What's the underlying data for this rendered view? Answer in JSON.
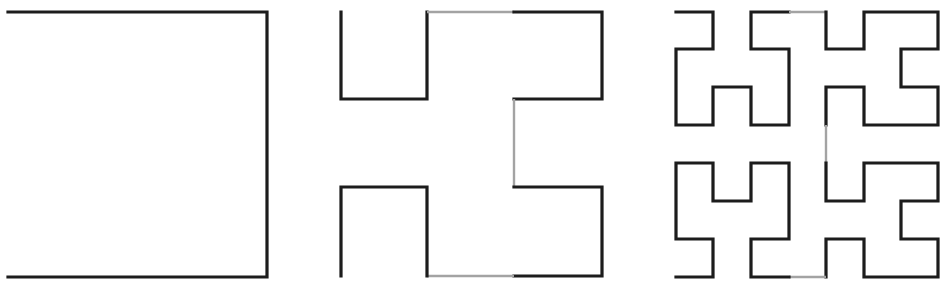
{
  "diagram": {
    "type": "hilbert-curve-iterations",
    "background": "#ffffff",
    "colors": {
      "curve": "#1c1c1c",
      "connector": "#a3a3a3"
    },
    "figures": [
      {
        "name": "order-1",
        "segments": [
          {
            "style": "black",
            "points": [
              [
                8,
                12
              ],
              [
                267,
                12
              ],
              [
                267,
                277
              ],
              [
                8,
                277
              ]
            ]
          }
        ]
      },
      {
        "name": "order-2",
        "segments": [
          {
            "style": "black",
            "points": [
              [
                341,
                12
              ],
              [
                341,
                99
              ],
              [
                427,
                99
              ],
              [
                427,
                12
              ]
            ]
          },
          {
            "style": "gray",
            "points": [
              [
                427,
                12
              ],
              [
                514,
                12
              ]
            ]
          },
          {
            "style": "black",
            "points": [
              [
                514,
                12
              ],
              [
                602,
                12
              ],
              [
                602,
                99
              ],
              [
                514,
                99
              ]
            ]
          },
          {
            "style": "gray",
            "points": [
              [
                514,
                99
              ],
              [
                514,
                187
              ]
            ]
          },
          {
            "style": "black",
            "points": [
              [
                514,
                187
              ],
              [
                602,
                187
              ],
              [
                602,
                276
              ],
              [
                514,
                276
              ]
            ]
          },
          {
            "style": "gray",
            "points": [
              [
                514,
                276
              ],
              [
                427,
                276
              ]
            ]
          },
          {
            "style": "black",
            "points": [
              [
                427,
                276
              ],
              [
                427,
                187
              ],
              [
                341,
                187
              ],
              [
                341,
                276
              ]
            ]
          }
        ]
      },
      {
        "name": "order-3",
        "segments": [
          {
            "style": "black",
            "points": [
              [
                676,
                12
              ],
              [
                713,
                12
              ],
              [
                713,
                49
              ],
              [
                676,
                49
              ],
              [
                676,
                125
              ],
              [
                713,
                125
              ],
              [
                713,
                87
              ],
              [
                751,
                87
              ],
              [
                751,
                125
              ],
              [
                789,
                125
              ],
              [
                789,
                49
              ],
              [
                751,
                49
              ],
              [
                751,
                12
              ],
              [
                789,
                12
              ]
            ]
          },
          {
            "style": "gray",
            "points": [
              [
                789,
                12
              ],
              [
                826,
                12
              ]
            ]
          },
          {
            "style": "black",
            "points": [
              [
                826,
                12
              ],
              [
                826,
                49
              ],
              [
                864,
                49
              ],
              [
                864,
                12
              ],
              [
                938,
                12
              ],
              [
                938,
                49
              ],
              [
                901,
                49
              ],
              [
                901,
                87
              ],
              [
                938,
                87
              ],
              [
                938,
                125
              ],
              [
                864,
                125
              ],
              [
                864,
                87
              ],
              [
                826,
                87
              ],
              [
                826,
                125
              ]
            ]
          },
          {
            "style": "gray",
            "points": [
              [
                826,
                125
              ],
              [
                826,
                163
              ]
            ]
          },
          {
            "style": "black",
            "points": [
              [
                826,
                163
              ],
              [
                826,
                201
              ],
              [
                864,
                201
              ],
              [
                864,
                163
              ],
              [
                938,
                163
              ],
              [
                938,
                201
              ],
              [
                901,
                201
              ],
              [
                901,
                239
              ],
              [
                938,
                239
              ],
              [
                938,
                277
              ],
              [
                864,
                277
              ],
              [
                864,
                239
              ],
              [
                826,
                239
              ],
              [
                826,
                277
              ]
            ]
          },
          {
            "style": "gray",
            "points": [
              [
                826,
                277
              ],
              [
                789,
                277
              ]
            ]
          },
          {
            "style": "black",
            "points": [
              [
                789,
                277
              ],
              [
                751,
                277
              ],
              [
                751,
                239
              ],
              [
                789,
                239
              ],
              [
                789,
                163
              ],
              [
                751,
                163
              ],
              [
                751,
                201
              ],
              [
                713,
                201
              ],
              [
                713,
                163
              ],
              [
                676,
                163
              ],
              [
                676,
                239
              ],
              [
                713,
                239
              ],
              [
                713,
                277
              ],
              [
                676,
                277
              ]
            ]
          }
        ]
      }
    ]
  }
}
